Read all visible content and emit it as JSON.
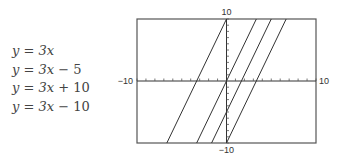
{
  "equations": [
    {
      "lhs": "y",
      "rhs_var": "3x",
      "rhs_rest": ""
    },
    {
      "lhs": "y",
      "rhs_var": "3x",
      "rhs_rest": " − 5"
    },
    {
      "lhs": "y",
      "rhs_var": "3x",
      "rhs_rest": " + 10"
    },
    {
      "lhs": "y",
      "rhs_var": "3x",
      "rhs_rest": " − 10"
    }
  ],
  "axis_labels": {
    "x_min": "−10",
    "x_max": "10",
    "y_min": "−10",
    "y_max": "10"
  },
  "colors": {
    "line": "#333333",
    "frame": "#555555",
    "text": "#444444"
  },
  "chart_data": {
    "type": "line",
    "title": "",
    "xlabel": "",
    "ylabel": "",
    "xlim": [
      -10,
      10
    ],
    "ylim": [
      -10,
      10
    ],
    "grid": false,
    "x_tick_step": 1,
    "y_tick_step": 1,
    "tick_labels": {
      "x": [
        "−10",
        "10"
      ],
      "y": [
        "−10",
        "10"
      ]
    },
    "legend": [
      "y = 3x",
      "y = 3x − 5",
      "y = 3x + 10",
      "y = 3x − 10"
    ],
    "legend_position": "left",
    "series": [
      {
        "name": "y = 3x",
        "slope": 3,
        "intercept": 0,
        "points": [
          [
            -3.33,
            -10
          ],
          [
            3.33,
            10
          ]
        ]
      },
      {
        "name": "y = 3x − 5",
        "slope": 3,
        "intercept": -5,
        "points": [
          [
            -1.67,
            -10
          ],
          [
            5,
            10
          ]
        ]
      },
      {
        "name": "y = 3x + 10",
        "slope": 3,
        "intercept": 10,
        "points": [
          [
            -6.67,
            -10
          ],
          [
            0,
            10
          ]
        ]
      },
      {
        "name": "y = 3x − 10",
        "slope": 3,
        "intercept": -10,
        "points": [
          [
            0,
            -10
          ],
          [
            6.67,
            10
          ]
        ]
      }
    ]
  }
}
